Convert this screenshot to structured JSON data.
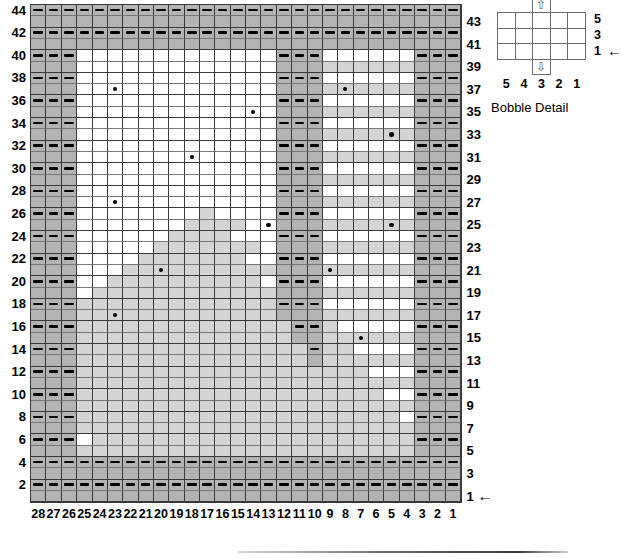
{
  "chart_data": {
    "type": "heatmap",
    "grid": {
      "columns": 28,
      "rows": 44
    },
    "xlabel": "Stitch number",
    "ylabel": "Row number",
    "column_labels": [
      "28",
      "27",
      "26",
      "25",
      "24",
      "23",
      "22",
      "21",
      "20",
      "19",
      "18",
      "17",
      "16",
      "15",
      "14",
      "13",
      "12",
      "11",
      "10",
      "9",
      "8",
      "7",
      "6",
      "5",
      "4",
      "3",
      "2",
      "1"
    ],
    "row_labels_left": [
      "44",
      "42",
      "40",
      "38",
      "36",
      "34",
      "32",
      "30",
      "28",
      "26",
      "24",
      "22",
      "20",
      "18",
      "16",
      "14",
      "12",
      "10",
      "8",
      "6",
      "4",
      "2"
    ],
    "row_labels_right": [
      "43",
      "41",
      "39",
      "37",
      "35",
      "33",
      "31",
      "29",
      "27",
      "25",
      "23",
      "21",
      "19",
      "17",
      "15",
      "13",
      "11",
      "9",
      "7",
      "5",
      "3",
      "1"
    ],
    "legend": {
      "dark_gray": "purl / reverse stockinette panel",
      "light_gray": "textured triangle motif",
      "dash": "purl stitch",
      "dot": "bobble"
    },
    "colors": {
      "dark_gray": "#b3b3b3",
      "light_gray": "#d4d4d4",
      "white": "#ffffff",
      "line": "#3a3a3a",
      "ink": "#000000"
    },
    "dark_gray_cells": {
      "note": "rows keyed by row number (1=bottom); values are stitch-number ranges inclusive",
      "rows": {
        "1": [
          [
            1,
            28
          ]
        ],
        "2": [
          [
            1,
            28
          ]
        ],
        "3": [
          [
            1,
            28
          ]
        ],
        "4": [
          [
            1,
            28
          ]
        ],
        "5": [
          [
            1,
            3
          ],
          [
            26,
            28
          ]
        ],
        "6": [
          [
            1,
            3
          ],
          [
            26,
            28
          ]
        ],
        "7": [
          [
            1,
            3
          ],
          [
            26,
            28
          ]
        ],
        "8": [
          [
            1,
            3
          ],
          [
            26,
            28
          ]
        ],
        "9": [
          [
            1,
            3
          ],
          [
            26,
            28
          ]
        ],
        "10": [
          [
            1,
            3
          ],
          [
            26,
            28
          ]
        ],
        "11": [
          [
            1,
            3
          ],
          [
            26,
            28
          ]
        ],
        "12": [
          [
            1,
            3
          ],
          [
            26,
            28
          ]
        ],
        "13": [
          [
            1,
            3
          ],
          [
            10,
            10
          ],
          [
            26,
            28
          ]
        ],
        "14": [
          [
            1,
            3
          ],
          [
            10,
            10
          ],
          [
            26,
            28
          ]
        ],
        "15": [
          [
            1,
            3
          ],
          [
            10,
            11
          ],
          [
            26,
            28
          ]
        ],
        "16": [
          [
            1,
            3
          ],
          [
            10,
            11
          ],
          [
            26,
            28
          ]
        ],
        "17": [
          [
            1,
            3
          ],
          [
            10,
            12
          ],
          [
            26,
            28
          ]
        ],
        "18": [
          [
            1,
            3
          ],
          [
            10,
            12
          ],
          [
            26,
            28
          ]
        ],
        "19": [
          [
            1,
            3
          ],
          [
            10,
            12
          ],
          [
            26,
            28
          ]
        ],
        "20": [
          [
            1,
            3
          ],
          [
            10,
            12
          ],
          [
            26,
            28
          ]
        ],
        "21": [
          [
            1,
            3
          ],
          [
            10,
            12
          ],
          [
            26,
            28
          ]
        ],
        "22": [
          [
            1,
            3
          ],
          [
            10,
            12
          ],
          [
            26,
            28
          ]
        ],
        "23": [
          [
            1,
            3
          ],
          [
            10,
            12
          ],
          [
            26,
            28
          ]
        ],
        "24": [
          [
            1,
            3
          ],
          [
            10,
            12
          ],
          [
            26,
            28
          ]
        ],
        "25": [
          [
            1,
            3
          ],
          [
            10,
            12
          ],
          [
            26,
            28
          ]
        ],
        "26": [
          [
            1,
            3
          ],
          [
            10,
            12
          ],
          [
            26,
            28
          ]
        ],
        "27": [
          [
            1,
            3
          ],
          [
            10,
            12
          ],
          [
            26,
            28
          ]
        ],
        "28": [
          [
            1,
            3
          ],
          [
            10,
            12
          ],
          [
            26,
            28
          ]
        ],
        "29": [
          [
            1,
            3
          ],
          [
            10,
            12
          ],
          [
            26,
            28
          ]
        ],
        "30": [
          [
            1,
            3
          ],
          [
            10,
            12
          ],
          [
            26,
            28
          ]
        ],
        "31": [
          [
            1,
            3
          ],
          [
            10,
            12
          ],
          [
            26,
            28
          ]
        ],
        "32": [
          [
            1,
            3
          ],
          [
            10,
            12
          ],
          [
            26,
            28
          ]
        ],
        "33": [
          [
            1,
            3
          ],
          [
            10,
            12
          ],
          [
            26,
            28
          ]
        ],
        "34": [
          [
            1,
            3
          ],
          [
            10,
            12
          ],
          [
            26,
            28
          ]
        ],
        "35": [
          [
            1,
            3
          ],
          [
            10,
            12
          ],
          [
            26,
            28
          ]
        ],
        "36": [
          [
            1,
            3
          ],
          [
            10,
            12
          ],
          [
            26,
            28
          ]
        ],
        "37": [
          [
            1,
            3
          ],
          [
            10,
            12
          ],
          [
            26,
            28
          ]
        ],
        "38": [
          [
            1,
            3
          ],
          [
            10,
            12
          ],
          [
            26,
            28
          ]
        ],
        "39": [
          [
            1,
            3
          ],
          [
            10,
            12
          ],
          [
            26,
            28
          ]
        ],
        "40": [
          [
            1,
            3
          ],
          [
            10,
            12
          ],
          [
            26,
            28
          ]
        ],
        "41": [
          [
            1,
            28
          ]
        ],
        "42": [
          [
            1,
            28
          ]
        ],
        "43": [
          [
            1,
            28
          ]
        ],
        "44": [
          [
            1,
            28
          ]
        ]
      }
    },
    "light_gray_cells": {
      "note": "light triangle motif; rows keyed by row number, values are stitch-number ranges inclusive",
      "rows": {
        "5": [
          [
            4,
            25
          ]
        ],
        "6": [
          [
            4,
            24
          ]
        ],
        "7": [
          [
            4,
            25
          ]
        ],
        "8": [
          [
            5,
            25
          ]
        ],
        "9": [
          [
            4,
            25
          ]
        ],
        "10": [
          [
            6,
            25
          ]
        ],
        "11": [
          [
            4,
            25
          ]
        ],
        "12": [
          [
            7,
            25
          ]
        ],
        "13": [
          [
            4,
            9
          ],
          [
            11,
            25
          ]
        ],
        "14": [
          [
            8,
            9
          ],
          [
            11,
            25
          ]
        ],
        "15": [
          [
            4,
            9
          ],
          [
            12,
            25
          ]
        ],
        "16": [
          [
            9,
            9
          ],
          [
            12,
            25
          ]
        ],
        "17": [
          [
            4,
            9
          ],
          [
            13,
            25
          ]
        ],
        "18": [
          [
            13,
            25
          ]
        ],
        "19": [
          [
            4,
            9
          ],
          [
            13,
            24
          ]
        ],
        "20": [
          [
            14,
            23
          ]
        ],
        "21": [
          [
            4,
            9
          ],
          [
            13,
            22
          ]
        ],
        "22": [
          [
            15,
            21
          ]
        ],
        "23": [
          [
            4,
            9
          ],
          [
            14,
            20
          ]
        ],
        "24": [
          [
            16,
            19
          ]
        ],
        "25": [
          [
            4,
            9
          ],
          [
            15,
            18
          ]
        ],
        "26": [
          [
            17,
            17
          ]
        ],
        "27": [
          [
            4,
            9
          ]
        ],
        "28": [],
        "29": [
          [
            4,
            9
          ]
        ],
        "30": [],
        "31": [
          [
            4,
            9
          ]
        ],
        "32": [],
        "33": [
          [
            4,
            9
          ]
        ],
        "34": [],
        "35": [
          [
            4,
            9
          ]
        ],
        "36": [],
        "37": [
          [
            4,
            9
          ]
        ],
        "38": [],
        "39": [
          [
            4,
            9
          ]
        ],
        "40": []
      }
    },
    "dash_rows": {
      "note": "purl dashes drawn on even rows; values are stitch-number ranges inclusive",
      "2": [
        [
          1,
          28
        ]
      ],
      "4": [
        [
          1,
          28
        ]
      ],
      "6": [
        [
          1,
          3
        ],
        [
          26,
          28
        ]
      ],
      "8": [
        [
          1,
          3
        ],
        [
          26,
          28
        ]
      ],
      "10": [
        [
          1,
          3
        ],
        [
          26,
          28
        ]
      ],
      "12": [
        [
          1,
          3
        ],
        [
          26,
          28
        ]
      ],
      "14": [
        [
          1,
          3
        ],
        [
          10,
          10
        ],
        [
          26,
          28
        ]
      ],
      "16": [
        [
          1,
          3
        ],
        [
          10,
          11
        ],
        [
          26,
          28
        ]
      ],
      "18": [
        [
          1,
          3
        ],
        [
          10,
          12
        ],
        [
          26,
          28
        ]
      ],
      "20": [
        [
          1,
          3
        ],
        [
          10,
          12
        ],
        [
          26,
          28
        ]
      ],
      "22": [
        [
          1,
          3
        ],
        [
          10,
          12
        ],
        [
          26,
          28
        ]
      ],
      "24": [
        [
          1,
          3
        ],
        [
          10,
          12
        ],
        [
          26,
          28
        ]
      ],
      "26": [
        [
          1,
          3
        ],
        [
          10,
          12
        ],
        [
          26,
          28
        ]
      ],
      "28": [
        [
          1,
          3
        ],
        [
          10,
          12
        ],
        [
          26,
          28
        ]
      ],
      "30": [
        [
          1,
          3
        ],
        [
          10,
          12
        ],
        [
          26,
          28
        ]
      ],
      "32": [
        [
          1,
          3
        ],
        [
          10,
          12
        ],
        [
          26,
          28
        ]
      ],
      "34": [
        [
          1,
          3
        ],
        [
          10,
          12
        ],
        [
          26,
          28
        ]
      ],
      "36": [
        [
          1,
          3
        ],
        [
          10,
          12
        ],
        [
          26,
          28
        ]
      ],
      "38": [
        [
          1,
          3
        ],
        [
          10,
          12
        ],
        [
          26,
          28
        ]
      ],
      "40": [
        [
          1,
          3
        ],
        [
          10,
          12
        ],
        [
          26,
          28
        ]
      ],
      "42": [
        [
          1,
          28
        ]
      ],
      "44": [
        [
          1,
          28
        ]
      ]
    },
    "bobbles": {
      "note": "each entry is [row, stitch]",
      "points": [
        [
          37,
          23
        ],
        [
          37,
          8
        ],
        [
          35,
          14
        ],
        [
          33,
          5
        ],
        [
          31,
          18
        ],
        [
          27,
          23
        ],
        [
          25,
          13
        ],
        [
          25,
          5
        ],
        [
          21,
          20
        ],
        [
          21,
          9
        ],
        [
          17,
          23
        ],
        [
          15,
          7
        ]
      ]
    },
    "start_arrows": [
      {
        "row": "1",
        "side": "right"
      }
    ]
  },
  "bobble_detail": {
    "caption": "Bobble Detail",
    "row_labels": [
      "5",
      "3",
      "1"
    ],
    "col_labels": [
      "5",
      "4",
      "3",
      "2",
      "1"
    ],
    "grid": {
      "columns": 5,
      "rows": 3
    },
    "symbols": [
      {
        "name": "make-bobble-top-symbol",
        "glyph": "⇧",
        "position": "above-column-3"
      },
      {
        "name": "make-bobble-bottom-symbol",
        "glyph": "⇩",
        "position": "below-column-3"
      }
    ],
    "arrow": "←"
  },
  "arrow_glyph": "←"
}
